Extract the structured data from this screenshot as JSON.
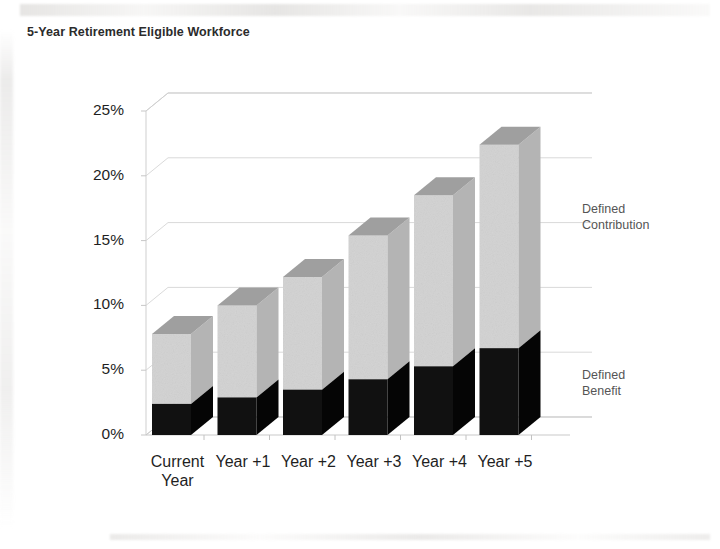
{
  "document": {
    "title": "5-Year Retirement Eligible Workforce",
    "background_color": "#ffffff"
  },
  "chart_data": {
    "type": "bar",
    "subtype": "stacked-3d-column",
    "title": "5-Year Retirement Eligible Workforce",
    "xlabel": "",
    "ylabel": "",
    "categories": [
      "Current Year",
      "Year +1",
      "Year +2",
      "Year +3",
      "Year +4",
      "Year +5"
    ],
    "series": [
      {
        "name": "Defined Benefit",
        "color": "#111111",
        "values": [
          2.4,
          2.9,
          3.5,
          4.3,
          5.3,
          6.7
        ]
      },
      {
        "name": "Defined Contribution",
        "color": "#d2d2d2",
        "values": [
          5.4,
          7.1,
          8.7,
          11.1,
          13.2,
          15.7
        ]
      }
    ],
    "totals": [
      7.8,
      10.0,
      12.2,
      15.4,
      18.5,
      22.4
    ],
    "ylim": [
      0,
      25
    ],
    "y_tick_values": [
      0,
      5,
      10,
      15,
      20,
      25
    ],
    "y_tick_labels": [
      "0%",
      "5%",
      "10%",
      "15%",
      "20%",
      "25%"
    ],
    "grid": true,
    "grid_color": "#d9d9d9",
    "legend_position": "right-inline",
    "value_unit": "%",
    "annotations": [
      {
        "text": "Defined\nContribution",
        "series": "Defined Contribution"
      },
      {
        "text": "Defined\nBenefit",
        "series": "Defined Benefit"
      }
    ]
  },
  "axis": {
    "y_labels": [
      "25%",
      "20%",
      "15%",
      "10%",
      "5%",
      "0%"
    ],
    "x_labels": [
      "Current\nYear",
      "Year +1",
      "Year +2",
      "Year +3",
      "Year +4",
      "Year +5"
    ]
  },
  "legend": {
    "defined_contribution": "Defined\nContribution",
    "defined_benefit": "Defined\nBenefit"
  }
}
